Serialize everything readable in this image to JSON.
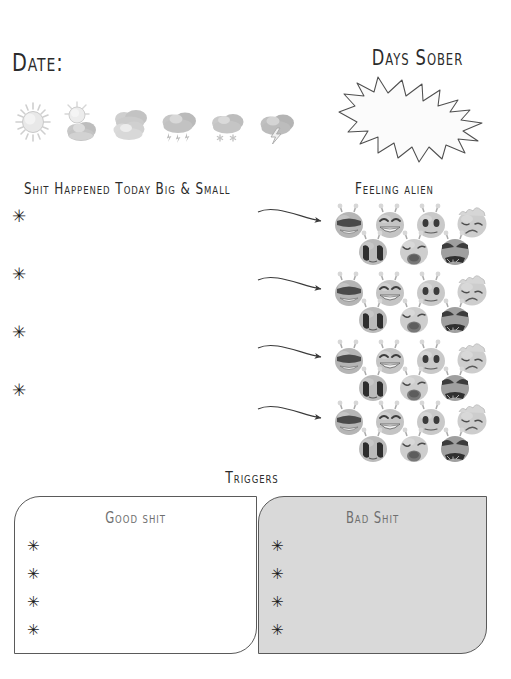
{
  "page": {
    "background": "#ffffff",
    "ink": "#2b2b2b"
  },
  "date_section": {
    "label": "Date:",
    "weather_icons": [
      {
        "name": "sun-icon",
        "label": "Sunny"
      },
      {
        "name": "partly-cloudy-icon",
        "label": "Partly cloudy"
      },
      {
        "name": "cloudy-icon",
        "label": "Cloudy"
      },
      {
        "name": "rain-icon",
        "label": "Rain"
      },
      {
        "name": "snow-icon",
        "label": "Snow"
      },
      {
        "name": "storm-icon",
        "label": "Storm"
      }
    ]
  },
  "days_sober": {
    "title": "Days Sober",
    "value": "",
    "shape": "starburst"
  },
  "shit_happened": {
    "title": "Shit Happened Today Big & Small",
    "bullet_glyph": "✳",
    "entries": [
      "",
      "",
      "",
      ""
    ]
  },
  "feeling_alien": {
    "title": "Feeling alien",
    "rows": 4,
    "faces_top": [
      {
        "name": "alien-cool-icon",
        "label": "Cool / sunglasses"
      },
      {
        "name": "alien-laughing-icon",
        "label": "Laughing"
      },
      {
        "name": "alien-neutral-icon",
        "label": "Neutral"
      },
      {
        "name": "alien-weary-icon",
        "label": "Weary / sad"
      }
    ],
    "faces_bottom": [
      {
        "name": "alien-crying-icon",
        "label": "Crying"
      },
      {
        "name": "alien-sobbing-icon",
        "label": "Sobbing"
      },
      {
        "name": "alien-angry-icon",
        "label": "Angry"
      }
    ],
    "arrow_glyph": "→"
  },
  "triggers": {
    "title": "Triggers",
    "good": {
      "heading": "Good shit",
      "background": "#ffffff",
      "entries": [
        "",
        "",
        "",
        ""
      ]
    },
    "bad": {
      "heading": "Bad Shit",
      "background": "#d9d9d9",
      "entries": [
        "",
        "",
        "",
        ""
      ]
    },
    "bullet_glyph": "✳"
  },
  "colors": {
    "ink": "#2b2b2b",
    "line": "#5a5a5a",
    "muted_text": "#6f6f6f",
    "bad_box_fill": "#d9d9d9",
    "icon_gray": "#9a9a9a"
  }
}
